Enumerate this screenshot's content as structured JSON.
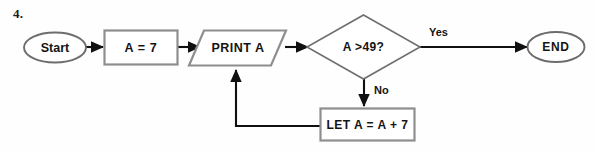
{
  "question": {
    "number": "4."
  },
  "flowchart": {
    "type": "flowchart",
    "nodes": [
      {
        "id": "start",
        "shape": "terminator-ellipse",
        "label": "Start"
      },
      {
        "id": "assign",
        "shape": "process-rectangle",
        "label": "A = 7"
      },
      {
        "id": "print",
        "shape": "io-parallelogram",
        "label": "PRINT A"
      },
      {
        "id": "decide",
        "shape": "decision-diamond",
        "label": "A >49?"
      },
      {
        "id": "end",
        "shape": "terminator-ellipse",
        "label": "END"
      },
      {
        "id": "let",
        "shape": "process-rectangle",
        "label": "LET A = A + 7"
      }
    ],
    "edges": [
      {
        "from": "start",
        "to": "assign",
        "label": ""
      },
      {
        "from": "assign",
        "to": "print",
        "label": ""
      },
      {
        "from": "print",
        "to": "decide",
        "label": ""
      },
      {
        "from": "decide",
        "to": "end",
        "label": "Yes"
      },
      {
        "from": "decide",
        "to": "let",
        "label": "No"
      },
      {
        "from": "let",
        "to": "print",
        "label": ""
      }
    ],
    "colors": {
      "background": "#fefefe",
      "shape_outline": "#8e8e8e",
      "diamond_outline": "#6f6f6f",
      "connector": "#101010",
      "text": "#141414"
    }
  }
}
